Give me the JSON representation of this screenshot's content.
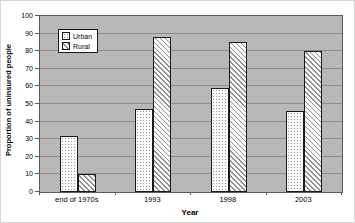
{
  "chart_data": {
    "type": "bar",
    "title": "",
    "xlabel": "Year",
    "ylabel": "Proportion of uninsured people",
    "categories": [
      "end of 1970s",
      "1993",
      "1998",
      "2003"
    ],
    "series": [
      {
        "name": "Urban",
        "pattern": "dots",
        "values": [
          32,
          47,
          59,
          46
        ]
      },
      {
        "name": "Rural",
        "pattern": "diagonal-stripes",
        "values": [
          10,
          88,
          85,
          80
        ]
      }
    ],
    "ylim": [
      0,
      100
    ],
    "yticks": [
      0,
      10,
      20,
      30,
      40,
      50,
      60,
      70,
      80,
      90,
      100
    ],
    "grid": true,
    "legend_position": "top-left-inside",
    "colors": {
      "plot_background": "#b8b8b8",
      "gridline": "#8c8c8c",
      "bar_border": "#1a1a1a",
      "bar_fill_base": "#fbfbfb",
      "pattern_ink": "#8f8f8f"
    }
  }
}
